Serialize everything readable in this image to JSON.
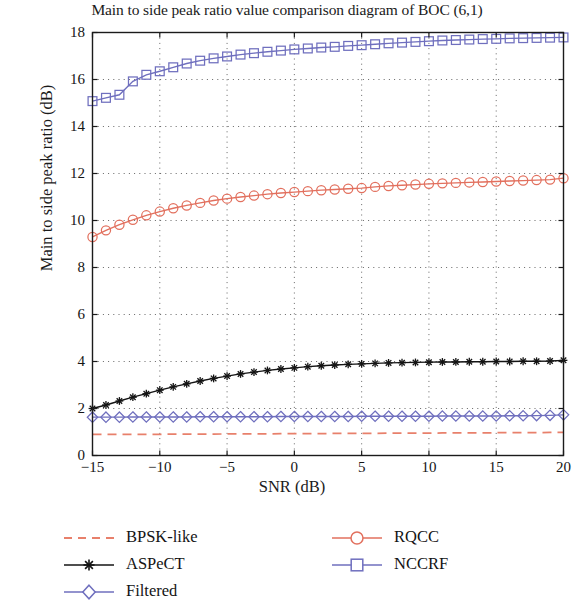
{
  "chart_data": {
    "type": "line",
    "title": "Main to side peak ratio value comparison diagram of BOC (6,1)",
    "xlabel": "SNR (dB)",
    "ylabel": "Main to side peak ratio (dB)",
    "xlim": [
      -15,
      20
    ],
    "ylim": [
      0,
      18
    ],
    "xticks": [
      -15,
      -10,
      -5,
      0,
      5,
      10,
      15,
      20
    ],
    "xticklabels": [
      "−15",
      "−10",
      "−5",
      "0",
      "5",
      "10",
      "15",
      "20"
    ],
    "yticks": [
      0,
      2,
      4,
      6,
      8,
      10,
      12,
      14,
      16,
      18
    ],
    "yticklabels": [
      "0",
      "2",
      "4",
      "6",
      "8",
      "10",
      "12",
      "14",
      "16",
      "18"
    ],
    "grid": "dotted",
    "legend_position": "below-axes",
    "x": [
      -15,
      -14,
      -13,
      -12,
      -11,
      -10,
      -9,
      -8,
      -7,
      -6,
      -5,
      -4,
      -3,
      -2,
      -1,
      0,
      1,
      2,
      3,
      4,
      5,
      6,
      7,
      8,
      9,
      10,
      11,
      12,
      13,
      14,
      15,
      16,
      17,
      18,
      19,
      20
    ],
    "series": [
      {
        "name": "BPSK-like",
        "color": "#e8806b",
        "linestyle": "dashed",
        "marker": "none",
        "values": [
          0.9,
          0.9,
          0.9,
          0.9,
          0.9,
          0.9,
          0.91,
          0.91,
          0.91,
          0.91,
          0.92,
          0.92,
          0.92,
          0.92,
          0.93,
          0.93,
          0.93,
          0.93,
          0.94,
          0.94,
          0.94,
          0.94,
          0.95,
          0.95,
          0.95,
          0.95,
          0.96,
          0.96,
          0.96,
          0.96,
          0.97,
          0.97,
          0.97,
          0.97,
          0.98,
          0.98
        ]
      },
      {
        "name": "ASPeCT",
        "color": "#141414",
        "linestyle": "solid",
        "marker": "star",
        "values": [
          2.0,
          2.15,
          2.32,
          2.48,
          2.63,
          2.78,
          2.92,
          3.05,
          3.17,
          3.28,
          3.38,
          3.47,
          3.55,
          3.62,
          3.68,
          3.73,
          3.78,
          3.82,
          3.85,
          3.88,
          3.9,
          3.92,
          3.94,
          3.95,
          3.96,
          3.97,
          3.98,
          3.98,
          3.99,
          3.99,
          4.0,
          4.0,
          4.01,
          4.01,
          4.02,
          4.05
        ]
      },
      {
        "name": "Filtered",
        "color": "#6f6fbe",
        "linestyle": "solid",
        "marker": "diamond",
        "values": [
          1.63,
          1.63,
          1.63,
          1.64,
          1.64,
          1.64,
          1.64,
          1.64,
          1.65,
          1.65,
          1.65,
          1.65,
          1.65,
          1.65,
          1.66,
          1.66,
          1.66,
          1.66,
          1.66,
          1.66,
          1.67,
          1.67,
          1.67,
          1.67,
          1.67,
          1.67,
          1.68,
          1.68,
          1.68,
          1.68,
          1.68,
          1.69,
          1.69,
          1.7,
          1.71,
          1.73
        ]
      },
      {
        "name": "RQCC",
        "color": "#e2705e",
        "linestyle": "solid",
        "marker": "circle",
        "values": [
          9.3,
          9.58,
          9.82,
          10.03,
          10.22,
          10.38,
          10.52,
          10.64,
          10.75,
          10.85,
          10.93,
          11.0,
          11.06,
          11.12,
          11.17,
          11.21,
          11.25,
          11.29,
          11.32,
          11.35,
          11.38,
          11.43,
          11.47,
          11.5,
          11.53,
          11.56,
          11.58,
          11.6,
          11.62,
          11.64,
          11.66,
          11.68,
          11.7,
          11.72,
          11.74,
          11.8
        ]
      },
      {
        "name": "NCCRF",
        "color": "#6f6fbe",
        "linestyle": "solid",
        "marker": "square",
        "values": [
          15.08,
          15.22,
          15.35,
          15.92,
          16.2,
          16.35,
          16.52,
          16.68,
          16.8,
          16.9,
          16.98,
          17.06,
          17.12,
          17.18,
          17.23,
          17.28,
          17.32,
          17.36,
          17.39,
          17.43,
          17.46,
          17.5,
          17.54,
          17.57,
          17.6,
          17.63,
          17.66,
          17.68,
          17.7,
          17.72,
          17.73,
          17.75,
          17.76,
          17.77,
          17.78,
          17.79
        ]
      }
    ]
  },
  "legend": {
    "entries": [
      {
        "label": "BPSK-like"
      },
      {
        "label": "ASPeCT"
      },
      {
        "label": "Filtered"
      },
      {
        "label": "RQCC"
      },
      {
        "label": "NCCRF"
      }
    ]
  }
}
